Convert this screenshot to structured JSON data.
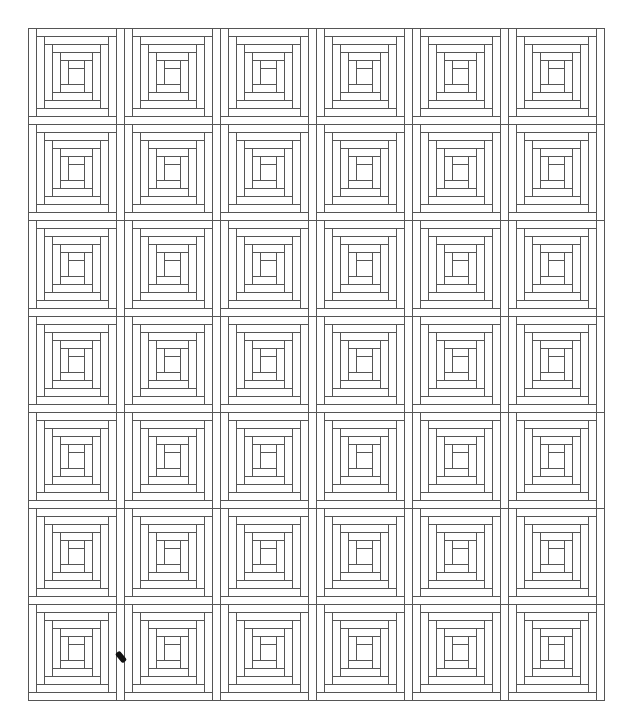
{
  "canvas": {
    "width": 635,
    "height": 725,
    "background": "#ffffff"
  },
  "quilt": {
    "pattern": "log-cabin",
    "origin_x": 28,
    "origin_y": 28,
    "columns": 6,
    "rows": 7,
    "block_size": 96,
    "rings": 5,
    "strip_width": 8,
    "center_size": 16,
    "line_color": "#555555",
    "line_width": 1,
    "fill_color": "#ffffff"
  },
  "mark": {
    "x": 118,
    "y": 651,
    "color": "#111111"
  }
}
